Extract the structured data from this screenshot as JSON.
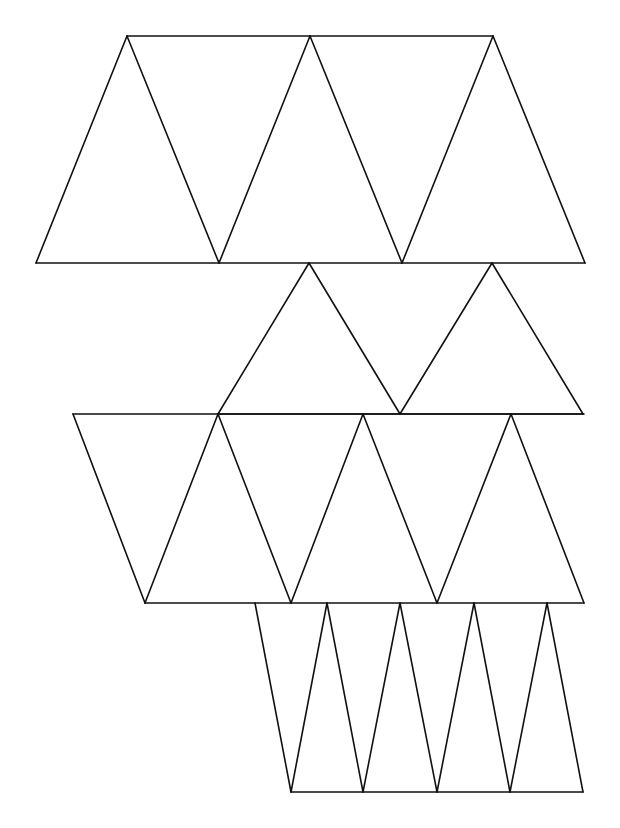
{
  "diagram": {
    "title": "",
    "line_color": "#111111",
    "background_color": "#ffffff",
    "bands": [
      {
        "name": "band-1",
        "shape": "isosceles triangles, alternating up/down",
        "triangle_count": 5
      },
      {
        "name": "band-2",
        "shape": "isosceles triangles, alternating up/down",
        "triangle_count": 3
      },
      {
        "name": "band-3",
        "shape": "isosceles triangles, alternating down/up",
        "triangle_count": 7
      },
      {
        "name": "band-4",
        "shape": "narrow isosceles triangles, alternating down/up",
        "triangle_count": 9
      }
    ]
  }
}
